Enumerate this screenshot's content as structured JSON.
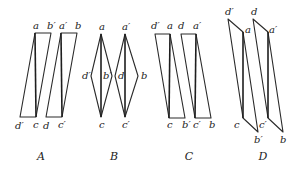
{
  "diagram": {
    "figures": [
      {
        "caption": "A",
        "shapes": [
          {
            "polygon": [
              [
                20,
                117
              ],
              [
                35,
                33
              ],
              [
                51,
                33
              ],
              [
                36,
                117
              ]
            ],
            "diagonal": [
              [
                35,
                33
              ],
              [
                36,
                117
              ]
            ]
          },
          {
            "polygon": [
              [
                46,
                117
              ],
              [
                61,
                33
              ],
              [
                77,
                33
              ],
              [
                62,
                117
              ]
            ],
            "diagonal": [
              [
                61,
                33
              ],
              [
                62,
                117
              ]
            ]
          }
        ],
        "labels": [
          {
            "text": "a",
            "x": 33,
            "y": 29
          },
          {
            "text": "b′",
            "x": 47,
            "y": 29
          },
          {
            "text": "a′",
            "x": 59,
            "y": 29
          },
          {
            "text": "b",
            "x": 75,
            "y": 29
          },
          {
            "text": "d′",
            "x": 15,
            "y": 129
          },
          {
            "text": "c",
            "x": 33,
            "y": 128
          },
          {
            "text": "d",
            "x": 43,
            "y": 129
          },
          {
            "text": "c′",
            "x": 58,
            "y": 128
          }
        ],
        "caption_x": 41
      },
      {
        "caption": "B",
        "shapes": [
          {
            "polygon": [
              [
                101,
                34
              ],
              [
                112,
                76
              ],
              [
                101,
                117
              ],
              [
                91,
                76
              ]
            ],
            "diagonal": [
              [
                101,
                34
              ],
              [
                101,
                117
              ]
            ]
          },
          {
            "polygon": [
              [
                125,
                34
              ],
              [
                138,
                76
              ],
              [
                125,
                117
              ],
              [
                115,
                76
              ]
            ],
            "diagonal": [
              [
                125,
                34
              ],
              [
                125,
                117
              ]
            ]
          }
        ],
        "labels": [
          {
            "text": "a",
            "x": 99,
            "y": 30
          },
          {
            "text": "a′",
            "x": 122,
            "y": 30
          },
          {
            "text": "d′",
            "x": 82,
            "y": 79
          },
          {
            "text": "b′",
            "x": 103,
            "y": 79
          },
          {
            "text": "d",
            "x": 118,
            "y": 79
          },
          {
            "text": "b",
            "x": 141,
            "y": 79
          },
          {
            "text": "c",
            "x": 99,
            "y": 128
          },
          {
            "text": "c′",
            "x": 122,
            "y": 128
          }
        ],
        "caption_x": 114
      },
      {
        "caption": "C",
        "shapes": [
          {
            "polygon": [
              [
                155,
                34
              ],
              [
                170,
                34
              ],
              [
                185,
                118
              ],
              [
                169,
                118
              ]
            ],
            "diagonal": [
              [
                170,
                34
              ],
              [
                169,
                118
              ]
            ]
          },
          {
            "polygon": [
              [
                181,
                34
              ],
              [
                196,
                34
              ],
              [
                211,
                118
              ],
              [
                195,
                118
              ]
            ],
            "diagonal": [
              [
                196,
                34
              ],
              [
                195,
                118
              ]
            ]
          }
        ],
        "labels": [
          {
            "text": "d′",
            "x": 151,
            "y": 29
          },
          {
            "text": "a",
            "x": 167,
            "y": 29
          },
          {
            "text": "d",
            "x": 178,
            "y": 29
          },
          {
            "text": "a′",
            "x": 193,
            "y": 29
          },
          {
            "text": "c",
            "x": 167,
            "y": 128
          },
          {
            "text": "b′",
            "x": 182,
            "y": 128
          },
          {
            "text": "c′",
            "x": 193,
            "y": 128
          },
          {
            "text": "b",
            "x": 209,
            "y": 128
          }
        ],
        "caption_x": 189
      },
      {
        "caption": "D",
        "shapes": [
          {
            "polygon": [
              [
                228,
                19
              ],
              [
                243,
                32
              ],
              [
                258,
                132
              ],
              [
                243,
                118
              ]
            ],
            "diagonal": [
              [
                243,
                32
              ],
              [
                243,
                118
              ]
            ]
          },
          {
            "polygon": [
              [
                253,
                19
              ],
              [
                268,
                32
              ],
              [
                283,
                132
              ],
              [
                268,
                118
              ]
            ],
            "diagonal": [
              [
                268,
                32
              ],
              [
                268,
                118
              ]
            ]
          }
        ],
        "labels": [
          {
            "text": "d′",
            "x": 225,
            "y": 15
          },
          {
            "text": "a",
            "x": 245,
            "y": 33
          },
          {
            "text": "d",
            "x": 251,
            "y": 15
          },
          {
            "text": "a′",
            "x": 269,
            "y": 33
          },
          {
            "text": "c",
            "x": 234,
            "y": 128
          },
          {
            "text": "b′",
            "x": 254,
            "y": 143
          },
          {
            "text": "c′",
            "x": 259,
            "y": 128
          },
          {
            "text": "b",
            "x": 280,
            "y": 143
          }
        ],
        "caption_x": 263
      }
    ],
    "caption_y": 160
  }
}
